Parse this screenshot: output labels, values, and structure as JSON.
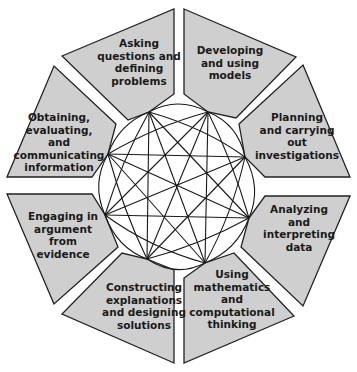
{
  "diagram": {
    "colors": {
      "panel_fill": "#cfcfcf",
      "outline": "#222222",
      "background": "#ffffff"
    },
    "practices": [
      {
        "id": "asking",
        "label": "Asking\nquestions and\ndefining\nproblems"
      },
      {
        "id": "models",
        "label": "Developing\nand using\nmodels"
      },
      {
        "id": "investigations",
        "label": "Planning\nand carrying\nout\ninvestigations"
      },
      {
        "id": "analyzing",
        "label": "Analyzing\nand\ninterpreting\ndata"
      },
      {
        "id": "math",
        "label": "Using\nmathematics\nand\ncomputational\nthinking"
      },
      {
        "id": "explanations",
        "label": "Constructing\nexplanations\nand designing\nsolutions"
      },
      {
        "id": "argument",
        "label": "Engaging in\nargument\nfrom\nevidence"
      },
      {
        "id": "communicating",
        "label": "Obtaining,\nevaluating,\nand\ncommunicating\ninformation"
      }
    ],
    "connections": "every practice connected to every other practice"
  }
}
